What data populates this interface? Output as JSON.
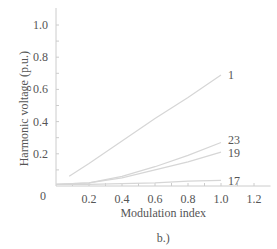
{
  "chart_data": {
    "type": "line",
    "title": "",
    "caption": "b.)",
    "xlabel": "Modulation index",
    "ylabel": "Harmonic voltage (p.u.)",
    "xlim": [
      0,
      1.3
    ],
    "ylim": [
      0,
      1.1
    ],
    "x_ticks": [
      0.2,
      0.4,
      0.6,
      0.8,
      1.0,
      1.2
    ],
    "x_tick_labels": [
      "0.2",
      "0.4",
      "0.6",
      "0.8",
      "1.0",
      "1.2"
    ],
    "y_ticks": [
      0.2,
      0.4,
      0.6,
      0.8,
      1.0
    ],
    "y_tick_labels": [
      "0.2",
      "0.4",
      "0.6",
      "0.8",
      "1.0"
    ],
    "origin_label": "0",
    "grid": false,
    "legend": "inline labels at line ends",
    "series": [
      {
        "name": "1",
        "x": [
          0.08,
          0.2,
          0.4,
          0.6,
          0.8,
          1.0
        ],
        "values": [
          0.06,
          0.14,
          0.28,
          0.42,
          0.55,
          0.69
        ]
      },
      {
        "name": "23",
        "x": [
          0.0,
          0.2,
          0.4,
          0.6,
          0.8,
          1.0
        ],
        "values": [
          0.01,
          0.02,
          0.06,
          0.12,
          0.19,
          0.27
        ]
      },
      {
        "name": "19",
        "x": [
          0.0,
          0.2,
          0.4,
          0.6,
          0.8,
          1.0
        ],
        "values": [
          0.01,
          0.02,
          0.05,
          0.1,
          0.15,
          0.21
        ]
      },
      {
        "name": "17",
        "x": [
          0.0,
          0.2,
          0.4,
          0.6,
          0.8,
          1.0
        ],
        "values": [
          0.01,
          0.01,
          0.015,
          0.02,
          0.03,
          0.035
        ]
      }
    ]
  },
  "colors": {
    "axis": "#cccccc",
    "line": "#d6d6d6",
    "text": "#555555"
  }
}
